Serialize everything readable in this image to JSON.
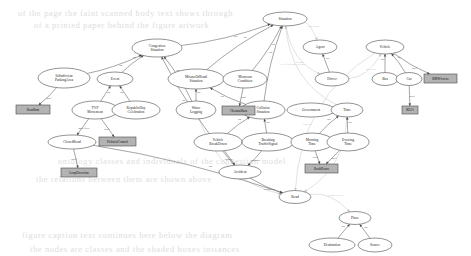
{
  "diagram": {
    "canvas": {
      "width": 471,
      "height": 256,
      "background": "#ffffff"
    },
    "style": {
      "class_node_fill": "#ffffff",
      "instance_node_fill": "#b3b3b3",
      "edge_color": "#5b5b5b",
      "faint_edge_color": "#c9c9c9",
      "label_color": "#1c1c1c"
    },
    "background_text_lines": [
      {
        "text": "of the page the faint scanned body text shows through",
        "x": 18,
        "y": 8
      },
      {
        "text": "of a printed paper behind the figure artwork",
        "x": 34,
        "y": 20
      },
      {
        "text": "ontology classes and individuals of the congestion model",
        "x": 58,
        "y": 156
      },
      {
        "text": "the relations between them are shown above",
        "x": 36,
        "y": 174
      },
      {
        "text": "figure caption text continues here below the diagram",
        "x": 22,
        "y": 230
      },
      {
        "text": "the nodes are classes and the shaded boxes instances",
        "x": 30,
        "y": 244
      }
    ],
    "nodes": [
      {
        "id": "situation",
        "label": "Situation",
        "kind": "class",
        "cx": 285,
        "cy": 19,
        "rx": 22,
        "ry": 7
      },
      {
        "id": "congestion_situation",
        "label": "Congestion\nSituation",
        "kind": "class",
        "cx": 157,
        "cy": 48,
        "rx": 25,
        "ry": 9
      },
      {
        "id": "insufficient_parking",
        "label": "InSufficient\nParkingArea",
        "kind": "class",
        "cx": 64,
        "cy": 78,
        "rx": 26,
        "ry": 10
      },
      {
        "id": "event",
        "label": "Event",
        "kind": "class",
        "cx": 115,
        "cy": 79,
        "rx": 18,
        "ry": 7
      },
      {
        "id": "misuse_of_road",
        "label": "MisuseOfRoad\nSituation",
        "kind": "class",
        "cx": 196,
        "cy": 79,
        "rx": 28,
        "ry": 10
      },
      {
        "id": "monsoon_condition",
        "label": "Monsoon\nCondition",
        "kind": "class",
        "cx": 245,
        "cy": 79,
        "rx": 22,
        "ry": 9
      },
      {
        "id": "agent",
        "label": "Agent",
        "kind": "class",
        "cx": 320,
        "cy": 47,
        "rx": 17,
        "ry": 7
      },
      {
        "id": "driver",
        "label": "Driver",
        "kind": "class",
        "cx": 332,
        "cy": 79,
        "rx": 17,
        "ry": 7
      },
      {
        "id": "vehicle",
        "label": "Vehicle",
        "kind": "class",
        "cx": 385,
        "cy": 47,
        "rx": 19,
        "ry": 7
      },
      {
        "id": "bus",
        "label": "Bus",
        "kind": "class",
        "cx": 385,
        "cy": 79,
        "rx": 13,
        "ry": 6.5
      },
      {
        "id": "car",
        "label": "Car",
        "kind": "class",
        "cx": 409,
        "cy": 79,
        "rx": 13,
        "ry": 6.5
      },
      {
        "id": "tvp_movement",
        "label": "TVP\nMovement",
        "kind": "class",
        "cx": 95,
        "cy": 110,
        "rx": 23,
        "ry": 9
      },
      {
        "id": "republic_day",
        "label": "RepublicDay\nCelebration",
        "kind": "class",
        "cx": 136,
        "cy": 110,
        "rx": 24,
        "ry": 9
      },
      {
        "id": "water_logging",
        "label": "Water\nLogging",
        "kind": "class",
        "cx": 196,
        "cy": 110,
        "rx": 20,
        "ry": 9
      },
      {
        "id": "collision_situation",
        "label": "Collision\nSituation",
        "kind": "class",
        "cx": 263,
        "cy": 110,
        "rx": 22,
        "ry": 9
      },
      {
        "id": "government",
        "label": "Government",
        "kind": "class",
        "cx": 311,
        "cy": 110,
        "rx": 24,
        "ry": 7
      },
      {
        "id": "time",
        "label": "Time",
        "kind": "class",
        "cx": 347,
        "cy": 110,
        "rx": 16,
        "ry": 7
      },
      {
        "id": "closed_road",
        "label": "ClosedRoad",
        "kind": "class",
        "cx": 72,
        "cy": 142,
        "rx": 24,
        "ry": 7
      },
      {
        "id": "vehicle_breakdown",
        "label": "Vehicle\nBreakDown",
        "kind": "class",
        "cx": 218,
        "cy": 142,
        "rx": 24,
        "ry": 9
      },
      {
        "id": "breaking_traffic_signal",
        "label": "Breaking\nTrafficSignal",
        "kind": "class",
        "cx": 268,
        "cy": 142,
        "rx": 26,
        "ry": 9
      },
      {
        "id": "morning_time",
        "label": "Morning\nTime",
        "kind": "class",
        "cx": 312,
        "cy": 142,
        "rx": 21,
        "ry": 9
      },
      {
        "id": "evening_time",
        "label": "Evening\nTime",
        "kind": "class",
        "cx": 348,
        "cy": 142,
        "rx": 21,
        "ry": 9
      },
      {
        "id": "accident",
        "label": "Accident",
        "kind": "class",
        "cx": 240,
        "cy": 172,
        "rx": 21,
        "ry": 7
      },
      {
        "id": "road",
        "label": "Road",
        "kind": "class",
        "cx": 295,
        "cy": 197,
        "rx": 16,
        "ry": 6.5
      },
      {
        "id": "place",
        "label": "Place",
        "kind": "class",
        "cx": 355,
        "cy": 218,
        "rx": 16,
        "ry": 6.5
      },
      {
        "id": "destination",
        "label": "Destination",
        "kind": "class",
        "cx": 332,
        "cy": 245,
        "rx": 23,
        "ry": 7
      },
      {
        "id": "source",
        "label": "Source",
        "kind": "class",
        "cx": 375,
        "cy": 245,
        "rx": 17,
        "ry": 7
      },
      {
        "id": "inst_roadjam",
        "label": "RoadJam",
        "kind": "instance",
        "x": 16,
        "y": 105,
        "w": 34,
        "h": 9
      },
      {
        "id": "inst_political",
        "label": "PoliticalControl",
        "kind": "instance",
        "x": 99,
        "y": 137,
        "w": 37,
        "h": 9
      },
      {
        "id": "inst_loopdirection",
        "label": "LoopDirection",
        "kind": "instance",
        "x": 61,
        "y": 168,
        "w": 36,
        "h": 9
      },
      {
        "id": "inst_chennairain",
        "label": "ChennaiRain",
        "kind": "instance",
        "x": 222,
        "y": 106,
        "w": 33,
        "h": 9
      },
      {
        "id": "inst_rushhour",
        "label": "RushHours",
        "kind": "instance",
        "x": 305,
        "y": 164,
        "w": 33,
        "h": 9
      },
      {
        "id": "inst_bmwxxx",
        "label": "BMWxxxxx",
        "kind": "instance",
        "x": 424,
        "y": 74,
        "w": 33,
        "h": 9
      },
      {
        "id": "inst_kl01",
        "label": "KL01",
        "kind": "instance",
        "x": 402,
        "y": 106,
        "w": 16,
        "h": 8
      }
    ],
    "edges": [
      {
        "from": "congestion_situation",
        "to": "situation",
        "label": "isa"
      },
      {
        "from": "misuse_of_road",
        "to": "situation",
        "label": "isa"
      },
      {
        "from": "monsoon_condition",
        "to": "situation",
        "label": "isa"
      },
      {
        "from": "collision_situation",
        "to": "situation",
        "label": "isa"
      },
      {
        "from": "insufficient_parking",
        "to": "congestion_situation",
        "label": "isa"
      },
      {
        "from": "event",
        "to": "congestion_situation",
        "label": "isa"
      },
      {
        "from": "water_logging",
        "to": "congestion_situation",
        "label": "isa"
      },
      {
        "from": "accident",
        "to": "congestion_situation",
        "label": "isa"
      },
      {
        "from": "tvp_movement",
        "to": "event",
        "label": "isa"
      },
      {
        "from": "republic_day",
        "to": "event",
        "label": "isa"
      },
      {
        "from": "water_logging",
        "to": "misuse_of_road",
        "label": "isa"
      },
      {
        "from": "collision_situation",
        "to": "misuse_of_road",
        "label": "isa"
      },
      {
        "from": "driver",
        "to": "agent",
        "label": "isa"
      },
      {
        "from": "bus",
        "to": "vehicle",
        "label": "isa"
      },
      {
        "from": "car",
        "to": "vehicle",
        "label": "isa"
      },
      {
        "from": "vehicle_breakdown",
        "to": "collision_situation",
        "label": "isa"
      },
      {
        "from": "breaking_traffic_signal",
        "to": "collision_situation",
        "label": "isa"
      },
      {
        "from": "morning_time",
        "to": "time",
        "label": "isa"
      },
      {
        "from": "evening_time",
        "to": "time",
        "label": "isa"
      },
      {
        "from": "destination",
        "to": "place",
        "label": "isa"
      },
      {
        "from": "source",
        "to": "place",
        "label": "isa"
      },
      {
        "from": "tvp_movement",
        "to": "closed_road",
        "label": "hasEffect"
      },
      {
        "from": "tvp_movement",
        "to": "inst_political",
        "label": "isOf"
      },
      {
        "from": "insufficient_parking",
        "to": "inst_roadjam",
        "label": "isOf"
      },
      {
        "from": "closed_road",
        "to": "inst_loopdirection",
        "label": "isOf"
      },
      {
        "from": "monsoon_condition",
        "to": "inst_chennairain",
        "label": "isOf"
      },
      {
        "from": "morning_time",
        "to": "inst_rushhour",
        "label": "isOf"
      },
      {
        "from": "evening_time",
        "to": "inst_rushhour",
        "label": "isOf"
      },
      {
        "from": "vehicle",
        "to": "inst_bmwxxx",
        "label": "isOf"
      },
      {
        "from": "car",
        "to": "inst_kl01",
        "label": "isOf"
      },
      {
        "from": "vehicle_breakdown",
        "to": "accident",
        "label": "causes"
      },
      {
        "from": "breaking_traffic_signal",
        "to": "accident",
        "label": "leadsTo"
      },
      {
        "from": "accident",
        "to": "road",
        "label": "occursAt"
      },
      {
        "from": "road",
        "to": "place",
        "label": "connectedTo"
      },
      {
        "from": "situation",
        "to": "driver",
        "label": "atTime"
      },
      {
        "from": "situation",
        "to": "agent",
        "label": "hasAgent"
      },
      {
        "from": "driver",
        "to": "vehicle",
        "label": "drivesBy"
      },
      {
        "from": "time",
        "to": "situation",
        "label": "isAffectedBy atTime"
      },
      {
        "from": "vehicle",
        "to": "road",
        "label": "runsOn"
      },
      {
        "from": "closed_road",
        "to": "road",
        "label": "isa"
      },
      {
        "from": "water_logging",
        "to": "road",
        "label": "occursOn"
      },
      {
        "from": "time",
        "to": "road",
        "label": "happensAt"
      }
    ],
    "edge_label_legend": {
      "isa": "subclass relation",
      "isOf": "instance of relation",
      "hasEffect": "effect relation",
      "occursAt": "location relation"
    }
  }
}
